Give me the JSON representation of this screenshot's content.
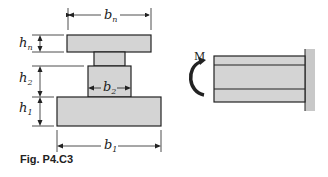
{
  "figure": {
    "caption": "Fig. P4.C3",
    "cross_section": {
      "labels": {
        "bn": {
          "base": "b",
          "sub": "n"
        },
        "hn": {
          "base": "h",
          "sub": "n"
        },
        "h2": {
          "base": "h",
          "sub": "2"
        },
        "b2": {
          "base": "b",
          "sub": "2"
        },
        "h1": {
          "base": "h",
          "sub": "1"
        },
        "b1": {
          "base": "b",
          "sub": "1"
        }
      }
    },
    "beam": {
      "moment_label": "M"
    },
    "colors": {
      "fill": "#d4d4d4",
      "stroke": "#222222",
      "wall": "#c8c8c8"
    }
  }
}
